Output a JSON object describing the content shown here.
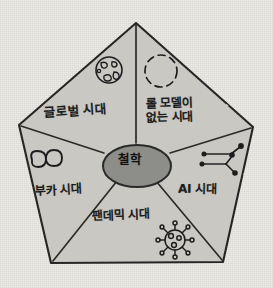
{
  "diagram": {
    "title_center": "철학",
    "shape": "pentagon",
    "center_node": {
      "label": "철학",
      "name": "philosophy",
      "fill_color": "#8d8d89",
      "stroke_color": "#2b2b2b"
    },
    "colors": {
      "background": "#ebe9e4",
      "pentagon_fill": "#c9c8c3",
      "outline": "#262626",
      "ink": "#1d1d1d"
    },
    "sectors": [
      {
        "id": "global",
        "label": "글로벌 시대",
        "icon": "globe-icon",
        "position": "top-left"
      },
      {
        "id": "no-role-model",
        "label": "롤 모델이\n없는 시대",
        "label_line1": "롤 모델이",
        "label_line2": "없는 시대",
        "icon": "dashed-circle-icon",
        "position": "top-right"
      },
      {
        "id": "ai",
        "label": "AI 시대",
        "icon": "neural-network-icon",
        "position": "right"
      },
      {
        "id": "pandemic",
        "label": "팬데믹 시대",
        "icon": "virus-icon",
        "position": "bottom"
      },
      {
        "id": "vuca",
        "label": "부카 시대",
        "icon": "wave-icon",
        "position": "left"
      }
    ]
  }
}
